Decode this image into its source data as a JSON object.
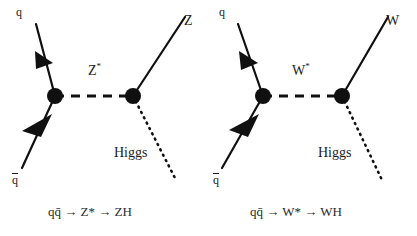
{
  "figure": {
    "background_color": "#ffffff",
    "line_color": "#101010",
    "text_color": "#1c1c1c",
    "width": 417,
    "height": 236
  },
  "diagrams": [
    {
      "id": "zh-production",
      "name": "qq-to-Zstar-to-ZH",
      "labels": {
        "incoming_quark": "q",
        "incoming_antiquark": "q̄",
        "propagator": "Z",
        "propagator_star": "*",
        "outgoing_boson": "Z",
        "outgoing_scalar": "Higgs"
      },
      "caption": "qq̄ → Z* → ZH",
      "caption_parts": {
        "initial": "qq̄",
        "arrow1": "→",
        "intermediate": "Z*",
        "arrow2": "→",
        "final": "ZH"
      },
      "geometry": {
        "left_vertex": [
          55,
          96
        ],
        "right_vertex": [
          133,
          96
        ],
        "quark_in_start": [
          36,
          24
        ],
        "antiquark_in_start": [
          22,
          168
        ],
        "boson_out_end": [
          185,
          17
        ],
        "higgs_out_end": [
          176,
          180
        ]
      }
    },
    {
      "id": "wh-production",
      "name": "qq-to-Wstar-to-WH",
      "labels": {
        "incoming_quark": "q",
        "incoming_antiquark": "q̄",
        "propagator": "W",
        "propagator_star": "*",
        "outgoing_boson": "W",
        "outgoing_scalar": "Higgs"
      },
      "caption": "qq̄ → W* → WH",
      "caption_parts": {
        "initial": "qq̄",
        "arrow1": "→",
        "intermediate": "W*",
        "arrow2": "→",
        "final": "WH"
      },
      "geometry": {
        "left_vertex": [
          263,
          96
        ],
        "right_vertex": [
          342,
          96
        ],
        "quark_in_start": [
          238,
          24
        ],
        "antiquark_in_start": [
          222,
          168
        ],
        "boson_out_end": [
          388,
          17
        ],
        "higgs_out_end": [
          382,
          180
        ]
      }
    }
  ],
  "line_styles": {
    "fermion": "solid-with-arrowhead",
    "propagator": "dashed",
    "higgs": "dotted"
  }
}
